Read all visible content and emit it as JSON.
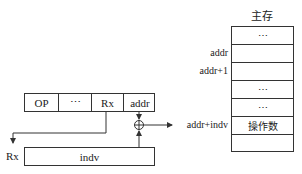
{
  "memory": {
    "title": "主存",
    "rows": [
      {
        "content": "⋯",
        "label": ""
      },
      {
        "content": "",
        "label": "addr"
      },
      {
        "content": "",
        "label": "addr+1"
      },
      {
        "content": "⋯",
        "label": ""
      },
      {
        "content": "⋯",
        "label": ""
      },
      {
        "content": "操作数",
        "label": "addr+indv"
      },
      {
        "content": "",
        "label": ""
      }
    ]
  },
  "instruction": {
    "fields": [
      "OP",
      "⋯",
      "Rx",
      "addr"
    ]
  },
  "register": {
    "name": "Rx",
    "content": "indv"
  },
  "adder": {
    "symbol": "⊕"
  },
  "colors": {
    "line": "#333333",
    "background": "#ffffff"
  }
}
